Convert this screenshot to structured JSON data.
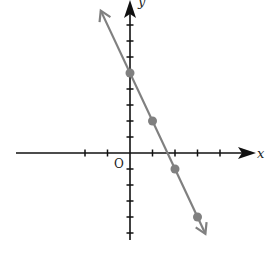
{
  "chart_data": {
    "type": "line",
    "title": "",
    "xlabel": "x",
    "ylabel": "y",
    "origin_label": "O",
    "grid": false,
    "equation": "y = -3x + 5",
    "x_ticks": [
      -2,
      -1,
      1,
      2,
      3,
      4
    ],
    "y_ticks": [
      -5,
      -4,
      -3,
      -2,
      -1,
      1,
      2,
      3,
      4,
      5,
      6,
      7,
      8
    ],
    "xlim": [
      -5,
      5.5
    ],
    "ylim": [
      -5.5,
      9.5
    ],
    "series": [
      {
        "name": "line",
        "x": [
          0,
          1,
          2,
          3
        ],
        "y": [
          5,
          2,
          -1,
          -4
        ],
        "color": "#808080"
      }
    ]
  },
  "axis_color": "#111111",
  "line_color": "#808080",
  "point_color": "#808080"
}
